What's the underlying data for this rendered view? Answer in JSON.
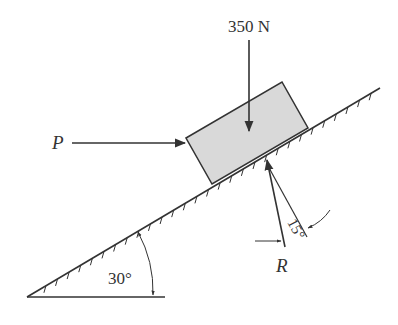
{
  "diagram": {
    "type": "inclined-plane-free-body",
    "forces": {
      "weight": {
        "label": "350 N",
        "direction": "down"
      },
      "push": {
        "label": "P",
        "direction": "horizontal-right"
      },
      "reaction": {
        "label": "R",
        "angle_from_normal": "15°"
      }
    },
    "incline": {
      "angle_label": "30°"
    },
    "colors": {
      "ink": "#333333",
      "block_fill": "#d9d9d9"
    }
  }
}
